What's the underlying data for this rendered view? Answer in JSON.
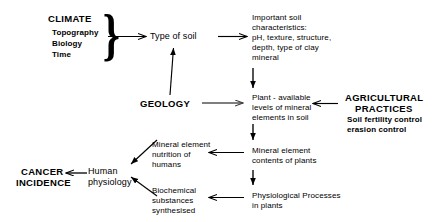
{
  "diagram": {
    "background_color": "#ffffff",
    "line_color": "#000000",
    "text_color": "#000000",
    "brace_glyph": "}",
    "nodes": {
      "climate": {
        "label": "CLIMATE",
        "sub_items": "Topography\nBiology\nTime"
      },
      "type_of_soil": {
        "label": "Type of soil"
      },
      "soil_characteristics": {
        "label": "Important soil\ncharacteristics:\npH, texture, structure,\ndepth, type of clay\nmineral"
      },
      "geology": {
        "label": "GEOLOGY"
      },
      "plant_available": {
        "label": "Plant - available\nlevels of mineral\nelements in soil"
      },
      "agricultural_practices": {
        "label": "AGRICULTURAL",
        "label_line2": "PRACTICES",
        "sub_items": "Soil fertility control\nerasion control"
      },
      "mineral_contents_plants": {
        "label": "Mineral element\ncontents of plants"
      },
      "mineral_nutrition_humans": {
        "label": "Mineral element\nnutrition of\nhumans"
      },
      "physiological_processes": {
        "label": "Physiological Processes\nin plants"
      },
      "biochemical_substances": {
        "label": "Biochemical\nsubstances\nsynthesised"
      },
      "human_physiology": {
        "label": "Human\nphysiology"
      },
      "cancer_incidence": {
        "label": "CANCER",
        "label_line2": "INCIDENCE"
      }
    },
    "edges": [
      {
        "name": "climate-to-type-of-soil",
        "from": "climate",
        "to": "type_of_soil"
      },
      {
        "name": "type-of-soil-to-characteristics",
        "from": "type_of_soil",
        "to": "soil_characteristics"
      },
      {
        "name": "geology-to-type-of-soil",
        "from": "geology",
        "to": "type_of_soil"
      },
      {
        "name": "characteristics-to-plant-available",
        "from": "soil_characteristics",
        "to": "plant_available"
      },
      {
        "name": "geology-to-plant-available",
        "from": "geology",
        "to": "plant_available"
      },
      {
        "name": "agricultural-to-plant-available",
        "from": "agricultural_practices",
        "to": "plant_available"
      },
      {
        "name": "plant-available-to-mineral-contents",
        "from": "plant_available",
        "to": "mineral_contents_plants"
      },
      {
        "name": "mineral-contents-to-nutrition",
        "from": "mineral_contents_plants",
        "to": "mineral_nutrition_humans"
      },
      {
        "name": "mineral-contents-to-physiological",
        "from": "mineral_contents_plants",
        "to": "physiological_processes"
      },
      {
        "name": "physiological-to-biochemical",
        "from": "physiological_processes",
        "to": "biochemical_substances"
      },
      {
        "name": "nutrition-to-human-physiology",
        "from": "mineral_nutrition_humans",
        "to": "human_physiology"
      },
      {
        "name": "biochemical-to-human-physiology",
        "from": "biochemical_substances",
        "to": "human_physiology"
      },
      {
        "name": "human-physiology-to-cancer",
        "from": "human_physiology",
        "to": "cancer_incidence"
      }
    ]
  }
}
